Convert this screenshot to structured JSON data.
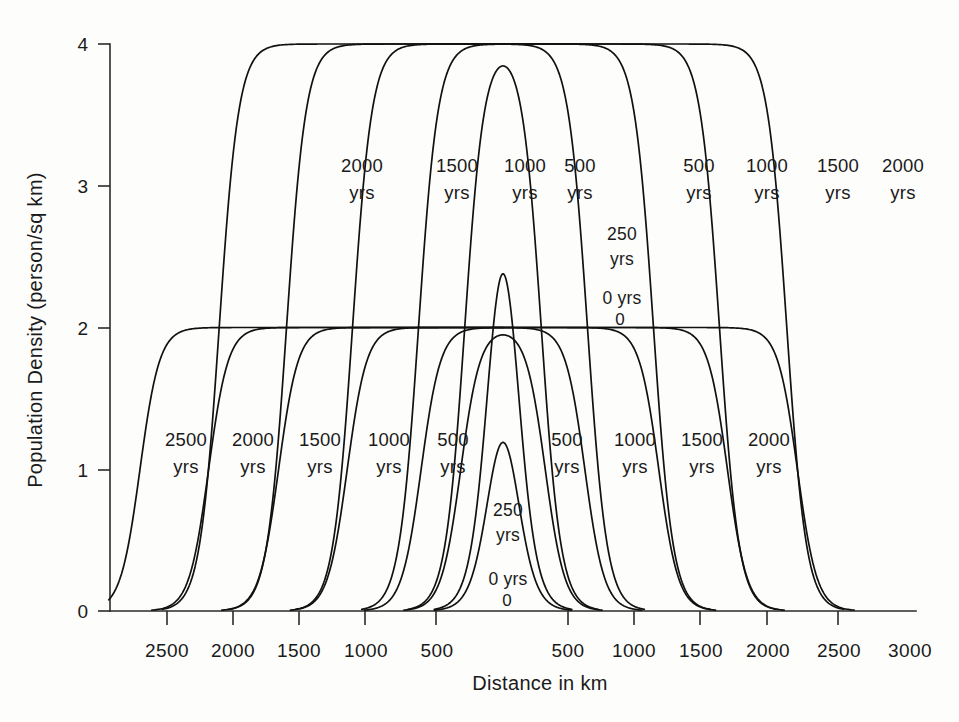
{
  "chart_data": {
    "type": "line",
    "title": "",
    "xlabel": "Distance in km",
    "ylabel": "Population Density (person/sq km)",
    "xlim": [
      -2900,
      3000
    ],
    "ylim": [
      0,
      4
    ],
    "grid": false,
    "legend_position": "none",
    "x_tick_labels": [
      "2500",
      "2000",
      "1500",
      "1000",
      "500",
      "500",
      "1000",
      "1500",
      "2000",
      "2500",
      "3000"
    ],
    "x_tick_values": [
      -2500,
      -2000,
      -1500,
      -1000,
      -500,
      500,
      1000,
      1500,
      2000,
      2500,
      3000
    ],
    "y_tick_labels": [
      "0",
      "1",
      "2",
      "3",
      "4"
    ],
    "y_tick_values": [
      0,
      1,
      2,
      3,
      4
    ],
    "series": [
      {
        "name": "0 yrs (lower)",
        "plateau": 2,
        "front_distance_km": 90,
        "side": "both"
      },
      {
        "name": "250 yrs (lower)",
        "plateau": 2,
        "front_distance_km": 320,
        "side": "both"
      },
      {
        "name": "500 yrs (lower)",
        "plateau": 2,
        "front_distance_km": 620,
        "side": "both"
      },
      {
        "name": "1000 yrs (lower)",
        "plateau": 2,
        "front_distance_km": 1180,
        "side": "both"
      },
      {
        "name": "1500 yrs (lower)",
        "plateau": 2,
        "front_distance_km": 1700,
        "side": "both"
      },
      {
        "name": "2000 yrs (lower)",
        "plateau": 2,
        "front_distance_km": 2230,
        "side": "both"
      },
      {
        "name": "2500 yrs (lower)",
        "plateau": 2,
        "front_distance_km": 2750,
        "side": "left"
      },
      {
        "name": "0 yrs (upper)",
        "plateau": 4,
        "front_distance_km": 90,
        "side": "both"
      },
      {
        "name": "250 yrs (upper)",
        "plateau": 4,
        "front_distance_km": 290,
        "side": "both"
      },
      {
        "name": "500 yrs (upper)",
        "plateau": 4,
        "front_distance_km": 640,
        "side": "both"
      },
      {
        "name": "1000 yrs (upper)",
        "plateau": 4,
        "front_distance_km": 1140,
        "side": "both"
      },
      {
        "name": "1500 yrs (upper)",
        "plateau": 4,
        "front_distance_km": 1640,
        "side": "both"
      },
      {
        "name": "2000 yrs (upper)",
        "plateau": 4,
        "front_distance_km": 2150,
        "side": "both"
      }
    ]
  },
  "axes": {
    "y_title": "Population Density (person/sq km)",
    "x_title": "Distance in km",
    "y_ticks": [
      {
        "label": "4"
      },
      {
        "label": "3"
      },
      {
        "label": "2"
      },
      {
        "label": "1"
      },
      {
        "label": "0"
      }
    ],
    "x_ticks_left": [
      {
        "label": "2500"
      },
      {
        "label": "2000"
      },
      {
        "label": "1500"
      },
      {
        "label": "1000"
      },
      {
        "label": "500"
      }
    ],
    "x_ticks_right": [
      {
        "label": "500"
      },
      {
        "label": "1000"
      },
      {
        "label": "1500"
      },
      {
        "label": "2000"
      },
      {
        "label": "2500"
      },
      {
        "label": "3000"
      }
    ]
  },
  "upper_labels_left": [
    {
      "value": "2000",
      "unit": "yrs"
    },
    {
      "value": "1500",
      "unit": "yrs"
    },
    {
      "value": "1000",
      "unit": "yrs"
    },
    {
      "value": "500",
      "unit": "yrs"
    }
  ],
  "upper_labels_right": [
    {
      "value": "500",
      "unit": "yrs"
    },
    {
      "value": "1000",
      "unit": "yrs"
    },
    {
      "value": "1500",
      "unit": "yrs"
    },
    {
      "value": "2000",
      "unit": "yrs"
    }
  ],
  "upper_center_labels": {
    "mid_value": "250",
    "mid_unit": "yrs",
    "zero_label": "0 yrs",
    "zero_mark": "0"
  },
  "lower_labels_left": [
    {
      "value": "2500",
      "unit": "yrs"
    },
    {
      "value": "2000",
      "unit": "yrs"
    },
    {
      "value": "1500",
      "unit": "yrs"
    },
    {
      "value": "1000",
      "unit": "yrs"
    },
    {
      "value": "500",
      "unit": "yrs"
    }
  ],
  "lower_labels_right": [
    {
      "value": "500",
      "unit": "yrs"
    },
    {
      "value": "1000",
      "unit": "yrs"
    },
    {
      "value": "1500",
      "unit": "yrs"
    },
    {
      "value": "2000",
      "unit": "yrs"
    }
  ],
  "lower_center_labels": {
    "mid_value": "250",
    "mid_unit": "yrs",
    "zero_label": "0 yrs",
    "zero_mark": "0"
  }
}
